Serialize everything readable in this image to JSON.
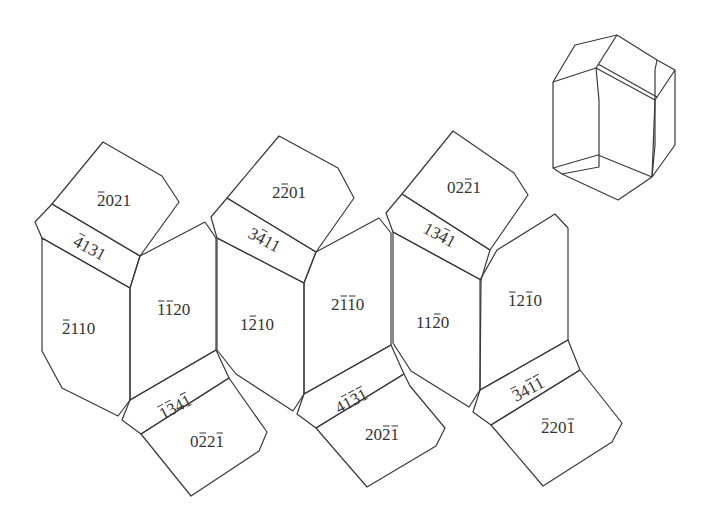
{
  "diagram": {
    "line_color": "#3a3a3a",
    "text_color": "#333333",
    "faces": [
      {
        "id": "top-pent-1",
        "label": "−2021",
        "display": "2021",
        "bars": [
          0
        ],
        "points": "52,204 103,142 162,176 179,202 140,256",
        "lx": 97,
        "ly": 206,
        "rot": 0
      },
      {
        "id": "band-top-1",
        "label": "−4131",
        "display": "4131",
        "bars": [
          0
        ],
        "points": "35,222 52,204 140,256 130,288 42,238",
        "lx": 72,
        "ly": 245,
        "rot": 28
      },
      {
        "id": "prism-1",
        "label": "−2110",
        "display": "2110",
        "bars": [
          0
        ],
        "points": "42,238 130,288 130,400 118,416 62,388 42,351",
        "lx": 62,
        "ly": 334,
        "rot": 0
      },
      {
        "id": "prism-2",
        "label": "−1−120",
        "display": "1120",
        "bars": [
          0,
          1
        ],
        "points": "130,288 140,256 205,222 216,238 216,350 130,400",
        "lx": 157,
        "ly": 315,
        "rot": 0
      },
      {
        "id": "band-bot-1",
        "label": "−1−134−1",
        "display": "1341",
        "bars": [
          0,
          1,
          3
        ],
        "points": "130,400 216,350 229,378 141,434 122,420",
        "lx": 163,
        "ly": 420,
        "rot": -28
      },
      {
        "id": "bot-pent-1",
        "label": "0−2−21−1",
        "display": "0221",
        "bars": [
          1,
          3
        ],
        "points": "141,434 229,378 238,391 267,432 259,451 191,496",
        "lx": 190,
        "ly": 447,
        "rot": 0
      },
      {
        "id": "top-pent-2",
        "label": "2−201",
        "display": "2201",
        "bars": [
          1
        ],
        "points": "227,198 279,136 338,168 354,198 316,252",
        "lx": 272,
        "ly": 198,
        "rot": 0
      },
      {
        "id": "band-top-2",
        "label": "3−411",
        "display": "3411",
        "bars": [
          1
        ],
        "points": "211,217 227,198 316,252 304,283 217,238",
        "lx": 247,
        "ly": 237,
        "rot": 28
      },
      {
        "id": "prism-3",
        "label": "1−210",
        "display": "1210",
        "bars": [
          1
        ],
        "points": "217,238 304,283 304,394 293,411 236,374 217,350",
        "lx": 240,
        "ly": 330,
        "rot": 0
      },
      {
        "id": "prism-4",
        "label": "2−1−10",
        "display": "2110",
        "bars": [
          1,
          2
        ],
        "points": "304,283 316,252 379,218 391,233 391,345 304,394",
        "lx": 331,
        "ly": 310,
        "rot": 0
      },
      {
        "id": "band-bot-2",
        "label": "4−1−31−1",
        "display": "4131",
        "bars": [
          1,
          2,
          3
        ],
        "points": "304,394 391,345 404,374 316,428 297,414",
        "lx": 339,
        "ly": 414,
        "rot": -28
      },
      {
        "id": "bot-pent-2",
        "label": "20−21−1",
        "display": "2021",
        "bars": [
          2,
          3
        ],
        "points": "316,428 404,374 410,386 445,428 436,446 367,487",
        "lx": 365,
        "ly": 440,
        "rot": 0
      },
      {
        "id": "top-pent-3",
        "label": "02−21",
        "display": "0221",
        "bars": [
          2
        ],
        "points": "402,194 453,131 514,173 528,195 490,250",
        "lx": 447,
        "ly": 193,
        "rot": 0
      },
      {
        "id": "band-top-3",
        "label": "13−41",
        "display": "1341",
        "bars": [
          2
        ],
        "points": "386,213 402,194 490,250 481,280 393,232",
        "lx": 422,
        "ly": 232,
        "rot": 28
      },
      {
        "id": "prism-5",
        "label": "11−20",
        "display": "1120",
        "bars": [
          2
        ],
        "points": "393,232 481,280 480,390 469,407 411,371 393,343",
        "lx": 416,
        "ly": 328,
        "rot": 0
      },
      {
        "id": "prism-6",
        "label": "−12−10",
        "display": "1210",
        "bars": [
          0,
          2
        ],
        "points": "480,280 497,250 555,214 568,228 568,340 480,390",
        "lx": 508,
        "ly": 306,
        "rot": 0
      },
      {
        "id": "band-bot-3",
        "label": "−34−1−1",
        "display": "3411",
        "bars": [
          0,
          2,
          3
        ],
        "points": "480,390 568,340 580,370 491,425 473,412",
        "lx": 516,
        "ly": 402,
        "rot": -28
      },
      {
        "id": "bot-pent-3",
        "label": "−220−1",
        "display": "2201",
        "bars": [
          0,
          3
        ],
        "points": "491,425 580,370 622,423 612,442 543,486",
        "lx": 541,
        "ly": 433,
        "rot": 0
      }
    ],
    "crystal_3d": {
      "lines": [
        "553,82 575,45 617,35 657,60 655,70 655,145 652,177",
        "553,82 553,168 562,174 618,200 652,177",
        "553,82 596,68 599,100 599,167 562,174",
        "596,68 617,35",
        "596,68 655,100 652,177",
        "598,64 657,97",
        "655,100 675,70 675,145 652,177",
        "657,60 675,70",
        "553,168 598,155 652,177"
      ]
    }
  }
}
